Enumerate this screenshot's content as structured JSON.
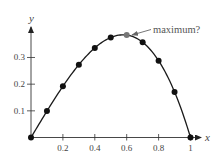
{
  "chart_data": {
    "type": "line",
    "title": "",
    "xlabel": "x",
    "ylabel": "y",
    "xlim": [
      0,
      1
    ],
    "ylim": [
      0,
      0.4
    ],
    "grid": false,
    "legend": null,
    "x_ticks": [
      0.2,
      0.4,
      0.6,
      0.8,
      1
    ],
    "x_tick_labels": [
      "0.2",
      "0.4",
      "0.6",
      "0.8",
      "1"
    ],
    "y_ticks": [
      0.1,
      0.2,
      0.3
    ],
    "y_tick_labels": [
      "0.1",
      "0.2",
      "0.3"
    ],
    "series": [
      {
        "name": "y = x - x^3 (sampled)",
        "x": [
          0,
          0.1,
          0.2,
          0.3,
          0.4,
          0.5,
          0.6,
          0.7,
          0.8,
          0.9,
          1.0
        ],
        "y": [
          0,
          0.099,
          0.192,
          0.273,
          0.336,
          0.375,
          0.384,
          0.357,
          0.288,
          0.171,
          0
        ],
        "markers": true,
        "highlighted_index": 6
      }
    ],
    "annotations": [
      {
        "text": "maximum?",
        "points_to": {
          "x": 0.6,
          "y": 0.384
        }
      }
    ]
  },
  "colors": {
    "line": "#1a1a1a",
    "marker": "#111111",
    "highlight_marker": "#777777",
    "axis": "#333333",
    "annotation": "#666666"
  }
}
